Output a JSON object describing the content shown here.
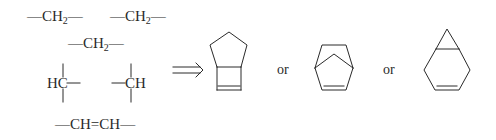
{
  "fragments": {
    "ch2_a": {
      "pre": "—CH",
      "sub": "2",
      "post": "—"
    },
    "ch2_b": {
      "pre": "—CH",
      "sub": "2",
      "post": "—"
    },
    "ch2_c": {
      "pre": "—CH",
      "sub": "2",
      "post": "—"
    },
    "hc_left": "HC",
    "ch_right": "CH",
    "vinylene": "—CH=CH—"
  },
  "arrow": {
    "symbol": "implies-arrow"
  },
  "products": [
    {
      "name": "bicyclo[3.2.0]hept-6-ene"
    },
    {
      "name": "norbornene (bicyclo[2.2.1]hept-2-ene)"
    },
    {
      "name": "bicyclo[4.1.0]hept-3-ene"
    }
  ],
  "connectors": [
    "or",
    "or"
  ],
  "colors": {
    "ink": "#2a2a2a",
    "background": "#ffffff"
  }
}
